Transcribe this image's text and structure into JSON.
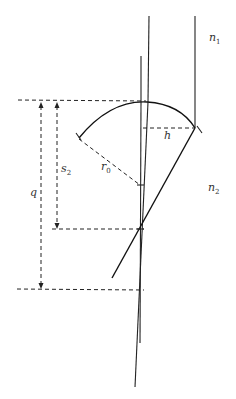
{
  "diagram": {
    "type": "optics-geometry",
    "labels": {
      "n1": {
        "base": "n",
        "sub": "1"
      },
      "n2": {
        "base": "n",
        "sub": "2"
      },
      "h": {
        "base": "h",
        "sub": ""
      },
      "r0": {
        "base": "r",
        "sub": "0"
      },
      "s2": {
        "base": "s",
        "sub": "2"
      },
      "q": {
        "base": "q",
        "sub": ""
      }
    },
    "colors": {
      "line": "#222222",
      "background": "#ffffff"
    }
  }
}
